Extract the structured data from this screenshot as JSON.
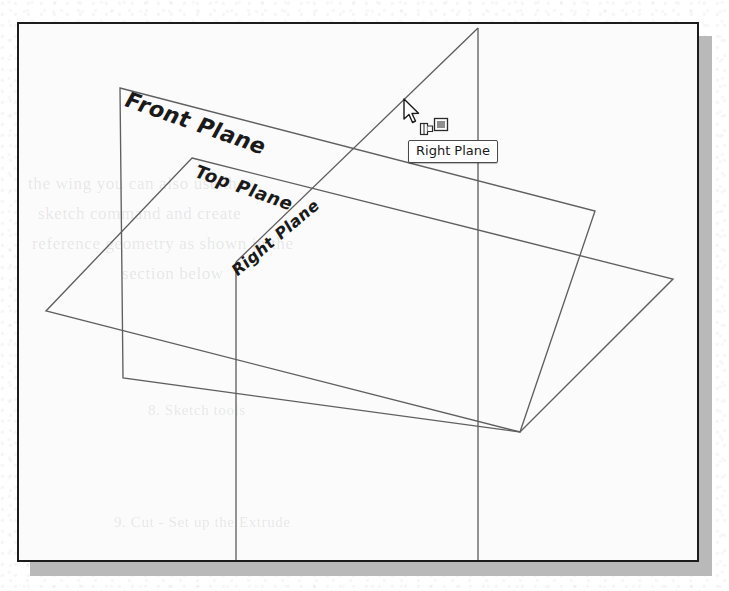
{
  "figure": {
    "kind": "cad-viewport-screenshot",
    "frame_border_color": "#1c1c1c",
    "shadow_color": "#b9b9b9",
    "background_color": "#fbfbfb",
    "line_color": "#5a5a5a"
  },
  "viewport": {
    "planes": [
      {
        "id": "front-plane",
        "label": "Front Plane",
        "orientation": "vertical-front",
        "corners": [
          [
            120,
            88
          ],
          [
            595,
            211
          ],
          [
            520,
            432
          ],
          [
            123,
            378
          ]
        ]
      },
      {
        "id": "top-plane",
        "label": "Top Plane",
        "orientation": "horizontal-top",
        "corners": [
          [
            192,
            158
          ],
          [
            673,
            279
          ],
          [
            520,
            432
          ],
          [
            46,
            311
          ]
        ]
      },
      {
        "id": "right-plane",
        "label": "Right Plane",
        "orientation": "vertical-right",
        "corners": [
          [
            478,
            28
          ],
          [
            478,
            562
          ],
          [
            236,
            562
          ],
          [
            236,
            262
          ]
        ]
      }
    ]
  },
  "labels": {
    "front": "Front Plane",
    "top": "Top Plane",
    "right": "Right Plane"
  },
  "tooltip": {
    "text": "Right Plane",
    "x": 408,
    "y": 140,
    "background": "#ffffff",
    "border_color": "#4a4a4a"
  },
  "cursor": {
    "icon": "arrow-pointer",
    "x": 402,
    "y": 98,
    "badge_icon": "select-plane-glyph"
  },
  "bleed_through": [
    {
      "text": "the  wing  you  can  also  use  the",
      "x": 26,
      "y": 172,
      "size": 17
    },
    {
      "text": "sketch  command  and  create",
      "x": 36,
      "y": 202,
      "size": 17
    },
    {
      "text": "reference  geometry  as  shown  in  the",
      "x": 30,
      "y": 232,
      "size": 17
    },
    {
      "text": "section  below",
      "x": 120,
      "y": 262,
      "size": 17
    },
    {
      "text": "8.   Sketch  tools",
      "x": 146,
      "y": 400,
      "size": 15
    },
    {
      "text": "9.   Cut  -  Set  up  the  Extrude",
      "x": 112,
      "y": 512,
      "size": 15
    }
  ]
}
